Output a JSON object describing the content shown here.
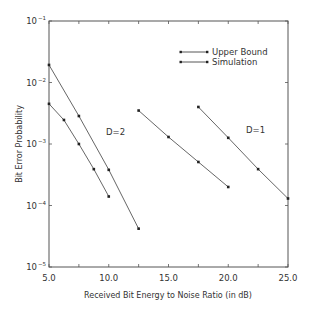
{
  "chart_data": {
    "type": "line",
    "title": "",
    "xlabel": "Received Bit Energy to Noise Ratio (in dB)",
    "ylabel": "Bit Error Probability",
    "xlim": [
      5.0,
      25.0
    ],
    "ylim": [
      1e-05,
      0.1
    ],
    "yscale": "log",
    "grid": false,
    "legend_position": "upper right",
    "x_ticks": [
      "5.0",
      "10.0",
      "15.0",
      "20.0",
      "25.0"
    ],
    "y_ticks": [
      {
        "base": "10",
        "exp": "-1"
      },
      {
        "base": "10",
        "exp": "-2"
      },
      {
        "base": "10",
        "exp": "-3"
      },
      {
        "base": "10",
        "exp": "-4"
      },
      {
        "base": "10",
        "exp": "-5"
      }
    ],
    "legend": [
      {
        "label": "Upper Bound"
      },
      {
        "label": "Simulation"
      }
    ],
    "annotations": [
      {
        "text": "D=2",
        "x": 10.1,
        "y": 0.0006
      },
      {
        "text": "D=1",
        "x": 21.6,
        "y": 0.0007
      }
    ],
    "series": [
      {
        "name": "Upper Bound (D=2)",
        "x": [
          5.0,
          7.5,
          10.0,
          12.5
        ],
        "y": [
          0.0193,
          0.00285,
          0.00038,
          4.2e-05
        ]
      },
      {
        "name": "Simulation (D=2)",
        "x": [
          5.0,
          6.25,
          7.5,
          8.75,
          10.0
        ],
        "y": [
          0.0045,
          0.00246,
          0.001,
          0.00039,
          0.00014
        ]
      },
      {
        "name": "Upper Bound / Simulation (D=1, left)",
        "x": [
          12.5,
          15.0,
          17.5,
          20.0
        ],
        "y": [
          0.0035,
          0.0013,
          0.00051,
          0.0002
        ]
      },
      {
        "name": "Upper Bound (D=1, right)",
        "x": [
          17.5,
          20.0,
          22.5,
          25.0
        ],
        "y": [
          0.004,
          0.00126,
          0.00039,
          0.00013
        ]
      }
    ]
  }
}
